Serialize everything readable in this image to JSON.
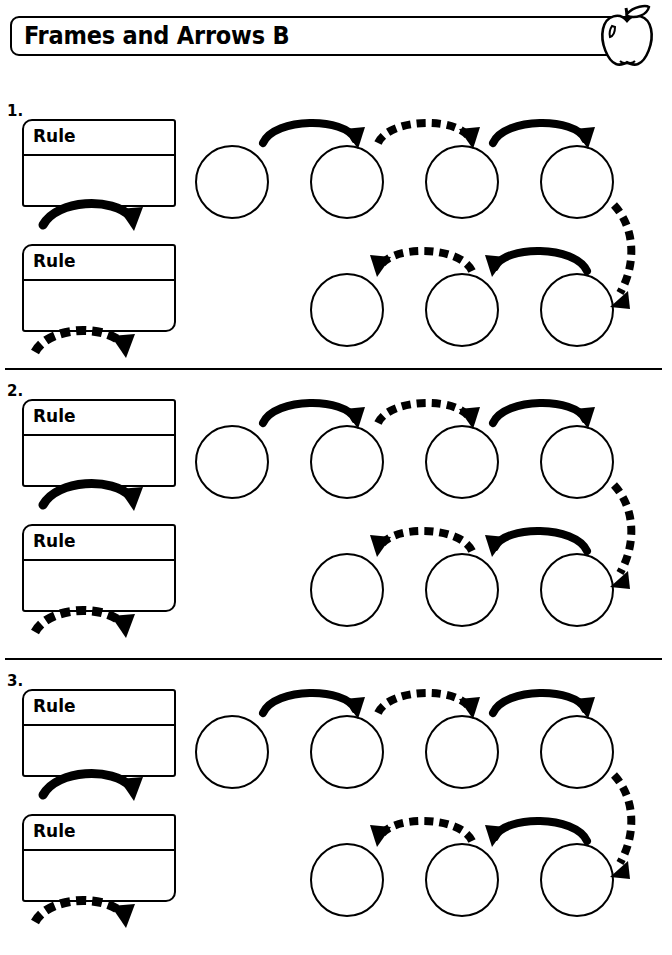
{
  "page": {
    "title": "Frames and Arrows B",
    "background_color": "#ffffff",
    "ink_color": "#000000"
  },
  "header": {
    "title": "Frames and Arrows B",
    "icon": "apple-icon"
  },
  "rule_label": "Rule",
  "sections": [
    {
      "number": "1.",
      "rule_boxes": [
        {
          "label": "Rule",
          "arrow_style": "solid"
        },
        {
          "label": "Rule",
          "arrow_style": "dashed"
        }
      ],
      "top_row_circles": 4,
      "bottom_row_circles": 3,
      "top_row_arrows": [
        "solid",
        "dashed",
        "solid"
      ],
      "bottom_row_arrows": [
        "dashed",
        "solid"
      ],
      "connector_arrow": "dashed"
    },
    {
      "number": "2.",
      "rule_boxes": [
        {
          "label": "Rule",
          "arrow_style": "solid"
        },
        {
          "label": "Rule",
          "arrow_style": "dashed"
        }
      ],
      "top_row_circles": 4,
      "bottom_row_circles": 3,
      "top_row_arrows": [
        "solid",
        "dashed",
        "solid"
      ],
      "bottom_row_arrows": [
        "dashed",
        "solid"
      ],
      "connector_arrow": "dashed"
    },
    {
      "number": "3.",
      "rule_boxes": [
        {
          "label": "Rule",
          "arrow_style": "solid"
        },
        {
          "label": "Rule",
          "arrow_style": "dashed"
        }
      ],
      "top_row_circles": 4,
      "bottom_row_circles": 3,
      "top_row_arrows": [
        "solid",
        "dashed",
        "solid"
      ],
      "bottom_row_arrows": [
        "dashed",
        "solid"
      ],
      "connector_arrow": "dashed"
    }
  ]
}
